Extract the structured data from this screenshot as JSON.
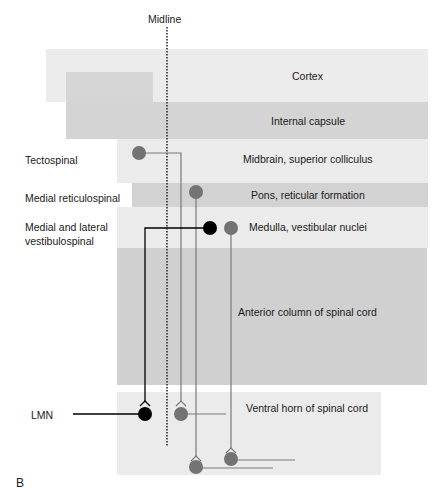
{
  "figure": {
    "panel_label": "B",
    "midline_label": "Midline",
    "colors": {
      "light_band": "#ebebeb",
      "mid_band": "#d4d4d4",
      "dark_band": "#cfcfcf",
      "grey_neuron": "#737373",
      "black_neuron": "#000000",
      "grey_line": "#7a7a7a"
    }
  },
  "regions": [
    {
      "id": "cortex",
      "label": "Cortex"
    },
    {
      "id": "internal-capsule",
      "label": "Internal capsule"
    },
    {
      "id": "midbrain",
      "label": "Midbrain, superior colliculus"
    },
    {
      "id": "pons",
      "label": "Pons, reticular formation"
    },
    {
      "id": "medulla",
      "label": "Medulla, vestibular nuclei"
    },
    {
      "id": "anterior-column",
      "label": "Anterior column of spinal cord"
    },
    {
      "id": "ventral-horn",
      "label": "Ventral horn of spinal cord"
    }
  ],
  "tracts": [
    {
      "id": "tectospinal",
      "label": "Tectospinal"
    },
    {
      "id": "medial-reticulospinal",
      "label": "Medial reticulospinal"
    },
    {
      "id": "vestibulospinal",
      "label": "Medial and lateral vestibulospinal"
    }
  ],
  "lmn_label": "LMN"
}
